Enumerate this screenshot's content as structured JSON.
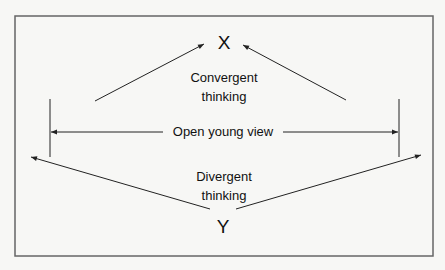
{
  "diagram": {
    "top_node": "X",
    "bottom_node": "Y",
    "convergent": {
      "line1": "Convergent",
      "line2": "thinking"
    },
    "middle": "Open young view",
    "divergent": {
      "line1": "Divergent",
      "line2": "thinking"
    }
  },
  "colors": {
    "line": "#222222",
    "frame": "#666666",
    "background": "#f7f7f5"
  }
}
